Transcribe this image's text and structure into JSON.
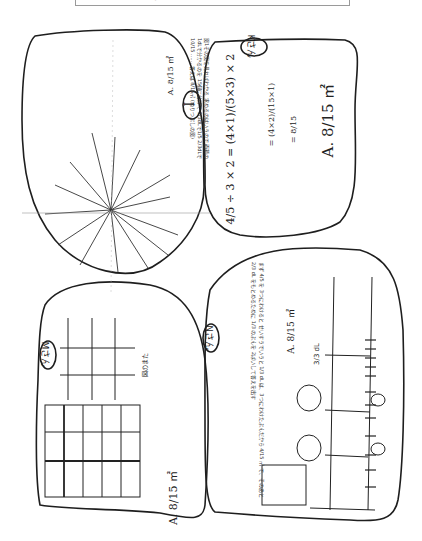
{
  "caption": {
    "text": "g"
  },
  "problem": {
    "expression": "4/5 ÷ 2/3",
    "answer": "8/15 m²"
  },
  "solutions": [
    {
      "id": "I",
      "label": "I",
      "explanation": "図1その図を見ればわかる 求めるのはいうので 面積の1dLで分かるのを 15個に分けて 1/3dLで1/5 2/3dLで10/15 …… 答えは 8/15㎡ (ぬりつぶしの図)",
      "spokes": [
        "1/3 dL",
        "1 dL",
        "2/3 dL",
        "4/5",
        "1dL分 4/5",
        "1/5"
      ],
      "answer": "A. 8/15 ㎡"
    },
    {
      "id": "K",
      "label": "Kさん",
      "steps": [
        "4/5 ÷ 3 × 2 = (4×1)/(5×3) × 2",
        "= (4×2)/(15×1)",
        "= 8/15"
      ],
      "answer": "A. 8/15 ㎡"
    },
    {
      "id": "M",
      "label": "Mさん",
      "table": {
        "headers": [
          "dL",
          "m²"
        ],
        "rows": [
          [
            "1",
            "4/5"
          ],
          [
            "2/3",
            "?"
          ]
        ],
        "note": "図のまた"
      },
      "grid": {
        "rows": [
          [
            "15",
            "10",
            "9"
          ],
          [
            "14",
            "8",
            "7"
          ],
          [
            "13",
            "6",
            "5"
          ],
          [
            "12",
            "4",
            "3"
          ],
          [
            "11",
            "2",
            "①"
          ]
        ],
        "axis_labels": [
          "1dL = 3/3 dL",
          "2/3 dL",
          "1/3 dL",
          "0",
          "4/5"
        ]
      },
      "answer": "A. 8/15 ㎡"
    },
    {
      "id": "N",
      "label": "Nさん",
      "explanation": "まず 4/5 を 3つにわけると せいすうでいうと 1/3 dL は、3つにわけたぶんだから 4/15 ㎡ で、そのあと 2/3 dL をもとめるために 1/3 のぶんを 2ばいして答えを出す",
      "answer": "A. 8/15 ㎡",
      "number_line": {
        "top_label": "3/3 dL",
        "marks": [
          "0",
          "1/15",
          "2/15",
          "3/15",
          "4/15 (1/3)",
          "5/15",
          "6/15",
          "7/15",
          "8/15 (2/3)",
          "9/15",
          "10/15",
          "11/15",
          "12/15 (4/5)"
        ],
        "circled": [
          "1dL/3",
          "2dL/3"
        ]
      },
      "box_note": [
        "4/15 × 2 = 8/15",
        "4/15 = 1/3",
        "2/3 × 1 = 2/15"
      ]
    }
  ]
}
